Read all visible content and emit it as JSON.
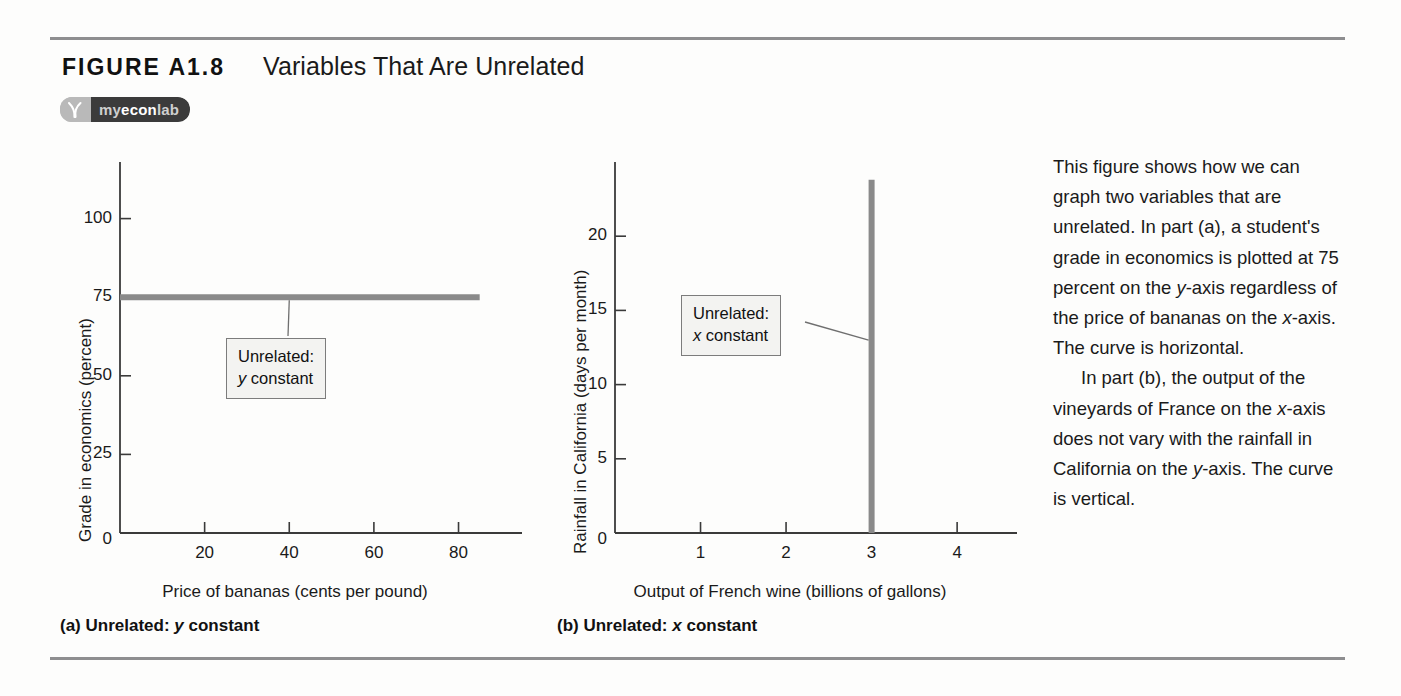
{
  "figure": {
    "number": "FIGURE A1.8",
    "title": "Variables That Are Unrelated",
    "badge_logo": "myeconlab-logo-icon",
    "badge_prefix": "my",
    "badge_mid": "econ",
    "badge_suffix": "lab"
  },
  "chart_data": [
    {
      "type": "line",
      "panel": "a",
      "title": "(a) Unrelated: y constant",
      "xlabel": "Price of bananas (cents per pound)",
      "ylabel": "Grade in economics (percent)",
      "xticks": [
        "0",
        "20",
        "40",
        "60",
        "80"
      ],
      "xtick_values": [
        0,
        20,
        40,
        60,
        80
      ],
      "yticks": [
        "25",
        "50",
        "75",
        "100"
      ],
      "ytick_values": [
        25,
        50,
        75,
        100
      ],
      "xlim": [
        0,
        95
      ],
      "ylim": [
        0,
        118
      ],
      "grid": false,
      "legend": "none",
      "series": [
        {
          "name": "Grade in economics",
          "orientation": "horizontal",
          "constant_value": 75,
          "x": [
            0,
            85
          ],
          "values": [
            75,
            75
          ],
          "color": "#8a8a8a"
        }
      ],
      "annotations": [
        {
          "line1": "Unrelated:",
          "line2_var": "y",
          "line2_rest": " constant",
          "points_to_x": 40,
          "points_to_y": 75
        }
      ]
    },
    {
      "type": "line",
      "panel": "b",
      "title": "(b) Unrelated: x constant",
      "xlabel": "Output of French wine (billions of gallons)",
      "ylabel": "Rainfall in California (days per month)",
      "xticks": [
        "0",
        "1",
        "2",
        "3",
        "4"
      ],
      "xtick_values": [
        0,
        1,
        2,
        3,
        4
      ],
      "yticks": [
        "5",
        "10",
        "15",
        "20"
      ],
      "ytick_values": [
        5,
        10,
        15,
        20
      ],
      "xlim": [
        0,
        4.7
      ],
      "ylim": [
        0,
        25
      ],
      "grid": false,
      "legend": "none",
      "series": [
        {
          "name": "Output of French wine",
          "orientation": "vertical",
          "constant_value": 3,
          "x": [
            3,
            3
          ],
          "values": [
            0,
            23.8
          ],
          "color": "#8a8a8a"
        }
      ],
      "annotations": [
        {
          "line1": "Unrelated:",
          "line2_var": "x",
          "line2_rest": " constant",
          "points_to_x": 3,
          "points_to_y": 13
        }
      ]
    }
  ],
  "side_text": {
    "p1_a": "This figure shows how we can graph two variables that are unrelated. In part (a), a student's grade in economics is plotted at 75 percent on the ",
    "p1_var1": "y",
    "p1_b": "-axis regardless of the price of bananas on the ",
    "p1_var2": "x",
    "p1_c": "-axis. The curve is horizontal.",
    "p2_a": "In part (b), the output of the vineyards of France on the ",
    "p2_var1": "x",
    "p2_b": "-axis does not vary with the rainfall in California on the ",
    "p2_var2": "y",
    "p2_c": "-axis. The curve is vertical."
  },
  "colors": {
    "curve": "#8a8a8a",
    "axis": "#3a3a3a",
    "rule": "#8e8e90",
    "callout_bg": "#f3f3f1",
    "callout_border": "#7c7c7c",
    "badge_dark": "#3b3b3b",
    "badge_light": "#b9b9b9"
  }
}
